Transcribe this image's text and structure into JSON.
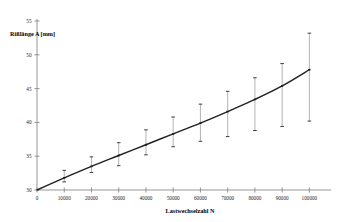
{
  "chart_data": {
    "type": "line",
    "title": "",
    "subtitle": "",
    "xlabel": "Lastwechselzahl N",
    "ylabel": "Rißlänge A [mm]",
    "xlim": [
      0,
      105000
    ],
    "ylim": [
      30,
      55
    ],
    "grid": false,
    "legend": null,
    "x_ticks": [
      0,
      10000,
      20000,
      30000,
      40000,
      50000,
      60000,
      70000,
      80000,
      90000,
      100000
    ],
    "x_tick_labels": [
      "0",
      "10000",
      "20000",
      "30000",
      "40000",
      "50000",
      "60000",
      "70000",
      "80000",
      "90000",
      "100000"
    ],
    "y_ticks": [
      30,
      35,
      40,
      45,
      50,
      55
    ],
    "y_tick_labels": [
      "30",
      "35",
      "40",
      "45",
      "50",
      "55"
    ],
    "series": [
      {
        "name": "Rißlänge Mittelwert",
        "type": "line",
        "x": [
          0,
          5000,
          10000,
          20000,
          30000,
          40000,
          50000,
          60000,
          70000,
          80000,
          90000,
          100000
        ],
        "values": [
          30.0,
          30.9,
          31.8,
          33.5,
          35.1,
          36.7,
          38.3,
          39.9,
          41.6,
          43.4,
          45.4,
          47.8
        ]
      },
      {
        "name": "Messpunkte mit Streubreite",
        "type": "errorbar",
        "x": [
          10000,
          20000,
          30000,
          40000,
          50000,
          60000,
          70000,
          80000,
          90000,
          100000
        ],
        "values": [
          31.8,
          33.5,
          35.1,
          36.7,
          38.3,
          39.9,
          41.6,
          43.4,
          45.4,
          47.8
        ],
        "y_lower": [
          31.2,
          32.6,
          33.6,
          35.2,
          36.4,
          37.2,
          37.9,
          38.8,
          39.4,
          40.2
        ],
        "y_upper": [
          32.9,
          34.9,
          37.0,
          38.9,
          40.8,
          42.7,
          44.6,
          46.6,
          48.7,
          53.2
        ]
      }
    ],
    "colors": {
      "curve": "#222222",
      "errorbar_stem": "#9a9a9a",
      "errorbar_cap": "#2a2a2a",
      "marker": "#1a1a1a",
      "axis": "#8a8a8a",
      "background": "#ffffff",
      "text": "#000000"
    }
  }
}
